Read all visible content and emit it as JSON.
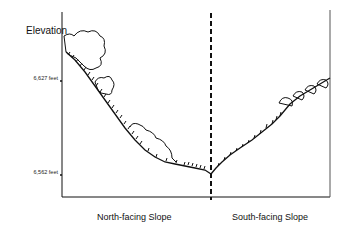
{
  "diagram": {
    "y_axis_title": "Elevation",
    "ticks": [
      {
        "label": "6,627 feet"
      },
      {
        "label": "6,562 feet"
      }
    ],
    "x_labels": {
      "north": "North-facing Slope",
      "south": "South-facing Slope"
    },
    "divider": "dashed vertical line at valley bottom",
    "colors": {
      "line": "#111111",
      "background": "#ffffff"
    }
  }
}
